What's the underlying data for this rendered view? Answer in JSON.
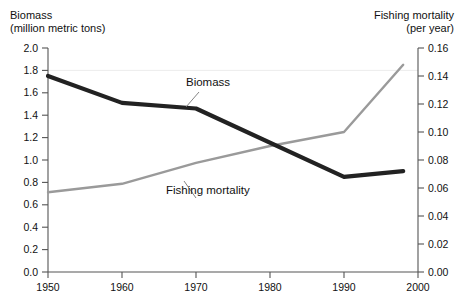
{
  "chart_data": {
    "type": "line",
    "title": "",
    "xlabel": "",
    "x": [
      1950,
      1960,
      1970,
      1980,
      1990,
      2000
    ],
    "xlim": [
      1950,
      2000
    ],
    "grid": "single faint horizontal gridline at left 1.8 / right 0.14",
    "legend_position": "inline annotations on the plot",
    "axes": {
      "left": {
        "label_line1": "Biomass",
        "label_line2": "(million metric tons)",
        "ylabel": "Biomass (million metric tons)",
        "ylim": [
          0.0,
          2.0
        ],
        "ticks": [
          "0.0",
          "0.2",
          "0.4",
          "0.6",
          "0.8",
          "1.0",
          "1.2",
          "1.4",
          "1.6",
          "1.8",
          "2.0"
        ]
      },
      "right": {
        "label_line1": "Fishing mortality",
        "label_line2": "(per year)",
        "ylabel": "Fishing mortality (per year)",
        "ylim": [
          0.0,
          0.16
        ],
        "ticks": [
          "0.00",
          "0.02",
          "0.04",
          "0.06",
          "0.08",
          "0.10",
          "0.12",
          "0.14",
          "0.16"
        ]
      },
      "bottom": {
        "ticks": [
          "1950",
          "1960",
          "1970",
          "1980",
          "1990",
          "2000"
        ]
      }
    },
    "series": [
      {
        "name": "Biomass",
        "axis": "left",
        "color": "#222222",
        "width": 4.2,
        "x": [
          1950,
          1960,
          1970,
          1990,
          1998
        ],
        "values": [
          1.75,
          1.51,
          1.46,
          0.85,
          0.9
        ]
      },
      {
        "name": "Fishing mortality",
        "axis": "right",
        "color": "#9a9a9a",
        "width": 2.4,
        "x": [
          1950,
          1960,
          1970,
          1980,
          1990,
          1998
        ],
        "values": [
          0.057,
          0.063,
          0.078,
          0.09,
          0.1,
          0.148
        ]
      }
    ],
    "annotations": [
      {
        "text": "Biomass",
        "series": "Biomass"
      },
      {
        "text": "Fishing mortality",
        "series": "Fishing mortality"
      }
    ]
  }
}
